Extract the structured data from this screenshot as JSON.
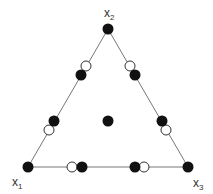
{
  "diagram": {
    "type": "simplex-lattice-design",
    "triangle": {
      "vertices": [
        [
          28,
          167
        ],
        [
          108,
          29
        ],
        [
          188,
          167
        ]
      ],
      "stroke": "#777777"
    },
    "labels": [
      {
        "base": "x",
        "sub": "1",
        "x": 12,
        "y": 186
      },
      {
        "base": "x",
        "sub": "2",
        "x": 104,
        "y": 17
      },
      {
        "base": "x",
        "sub": "3",
        "x": 193,
        "y": 187
      }
    ],
    "filled_points": [
      [
        28,
        167
      ],
      [
        108,
        29
      ],
      [
        188,
        167
      ],
      [
        81,
        75
      ],
      [
        135,
        75
      ],
      [
        54,
        121
      ],
      [
        162,
        121
      ],
      [
        82,
        167
      ],
      [
        135,
        167
      ],
      [
        108,
        121
      ]
    ],
    "open_points": [
      [
        86,
        66
      ],
      [
        130,
        66
      ],
      [
        49,
        130
      ],
      [
        166,
        130
      ],
      [
        72,
        167
      ],
      [
        144,
        167
      ]
    ],
    "colors": {
      "filled": "#111111",
      "open_stroke": "#333333",
      "open_fill": "#ffffff"
    }
  }
}
